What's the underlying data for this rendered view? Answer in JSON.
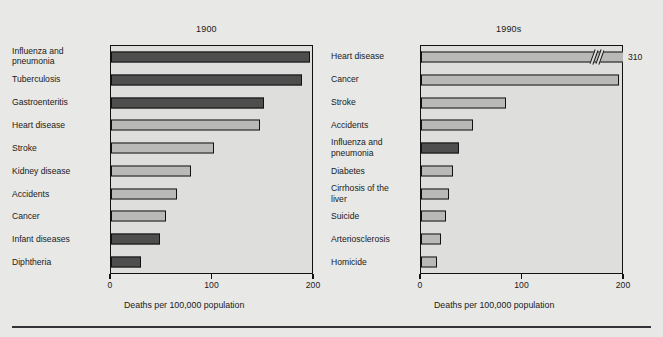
{
  "chart_data": [
    {
      "type": "bar",
      "title": "1900",
      "xlabel": "Deaths per 100,000 population",
      "ylabel": "",
      "xlim": [
        0,
        200
      ],
      "xticks": [
        "0",
        "100",
        "200"
      ],
      "grid": false,
      "orientation": "horizontal",
      "categories": [
        "Influenza and\npneumonia",
        "Tuberculosis",
        "Gastroenteritis",
        "Heart disease",
        "Stroke",
        "Kidney disease",
        "Accidents",
        "Cancer",
        "Infant diseases",
        "Diphtheria"
      ],
      "values": [
        198,
        190,
        152,
        148,
        102,
        80,
        66,
        55,
        49,
        30
      ],
      "shades": [
        "dark",
        "dark",
        "dark",
        "light",
        "light",
        "light",
        "light",
        "light",
        "dark",
        "dark"
      ]
    },
    {
      "type": "bar",
      "title": "1990s",
      "xlabel": "Deaths per 100,000 population",
      "ylabel": "",
      "xlim": [
        0,
        200
      ],
      "xticks": [
        "0",
        "100",
        "200"
      ],
      "grid": false,
      "orientation": "horizontal",
      "categories": [
        "Heart disease",
        "Cancer",
        "Stroke",
        "Accidents",
        "Influenza and\npneumonia",
        "Diabetes",
        "Cirrhosis of the\nliver",
        "Suicide",
        "Arteriosclerosis",
        "Homicide"
      ],
      "values": [
        310,
        197,
        85,
        52,
        38,
        32,
        28,
        25,
        20,
        16
      ],
      "shades": [
        "light",
        "light",
        "light",
        "light",
        "dark",
        "light",
        "light",
        "light",
        "light",
        "light"
      ],
      "annotations": [
        {
          "category": "Heart disease",
          "value_label": "310",
          "axis_break": true
        }
      ]
    }
  ],
  "panels": {
    "left": {
      "title": "1900",
      "xtitle": "Deaths per 100,000 population",
      "categories": [
        {
          "line1": "Influenza and",
          "line2": "pneumonia"
        },
        {
          "line1": "Tuberculosis",
          "line2": ""
        },
        {
          "line1": "Gastroenteritis",
          "line2": ""
        },
        {
          "line1": "Heart disease",
          "line2": ""
        },
        {
          "line1": "Stroke",
          "line2": ""
        },
        {
          "line1": "Kidney disease",
          "line2": ""
        },
        {
          "line1": "Accidents",
          "line2": ""
        },
        {
          "line1": "Cancer",
          "line2": ""
        },
        {
          "line1": "Infant diseases",
          "line2": ""
        },
        {
          "line1": "Diphtheria",
          "line2": ""
        }
      ],
      "ticks": [
        {
          "label": "0",
          "pct": 0
        },
        {
          "label": "100",
          "pct": 50
        },
        {
          "label": "200",
          "pct": 100
        }
      ]
    },
    "right": {
      "title": "1990s",
      "xtitle": "Deaths per 100,000 population",
      "categories": [
        {
          "line1": "Heart disease",
          "line2": ""
        },
        {
          "line1": "Cancer",
          "line2": ""
        },
        {
          "line1": "Stroke",
          "line2": ""
        },
        {
          "line1": "Accidents",
          "line2": ""
        },
        {
          "line1": "Influenza and",
          "line2": "pneumonia"
        },
        {
          "line1": "Diabetes",
          "line2": ""
        },
        {
          "line1": "Cirrhosis of the",
          "line2": "liver"
        },
        {
          "line1": "Suicide",
          "line2": ""
        },
        {
          "line1": "Arteriosclerosis",
          "line2": ""
        },
        {
          "line1": "Homicide",
          "line2": ""
        }
      ],
      "ticks": [
        {
          "label": "0",
          "pct": 0
        },
        {
          "label": "100",
          "pct": 50
        },
        {
          "label": "200",
          "pct": 100
        }
      ],
      "overflow_value_label": "310"
    }
  },
  "colors": {
    "page_background": "#e8e8e6",
    "plot_background": "#dededc",
    "bar_light": "#b9b9b7",
    "bar_dark": "#4e4e4e",
    "outline": "#121212",
    "text": "#1a1a1a",
    "rule": "#33333a"
  }
}
